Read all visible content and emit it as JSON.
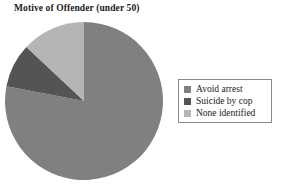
{
  "chart_data": {
    "type": "pie",
    "title": "Motive of Offender (under 50)",
    "categories": [
      "Avoid arrest",
      "Suicide by cop",
      "None identified"
    ],
    "values": [
      78,
      9,
      13
    ],
    "unit": "percent",
    "colors": [
      "#808080",
      "#545454",
      "#b5b5b5"
    ],
    "start_angle_deg": 90,
    "direction": "clockwise",
    "legend_position": "right",
    "legend_border": true,
    "grid": false,
    "xlabel": "",
    "ylabel": "",
    "slices": [
      {
        "label": "Avoid arrest",
        "value": 78,
        "color": "#808080"
      },
      {
        "label": "Suicide by cop",
        "value": 9,
        "color": "#545454"
      },
      {
        "label": "None identified",
        "value": 13,
        "color": "#b5b5b5"
      }
    ]
  },
  "title": "Motive of Offender (under 50)",
  "legend": {
    "items": [
      {
        "label": "Avoid arrest",
        "color": "#808080"
      },
      {
        "label": "Suicide by cop",
        "color": "#545454"
      },
      {
        "label": "None identified",
        "color": "#b5b5b5"
      }
    ]
  }
}
